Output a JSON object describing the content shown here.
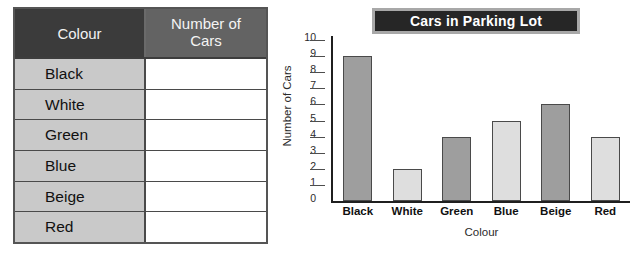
{
  "worksheet": {
    "table": {
      "headers": [
        "Colour",
        "Number of\nCars"
      ],
      "header_colour": "Colour",
      "header_count_line1": "Number of",
      "header_count_line2": "Cars",
      "rows": [
        {
          "label": "Black",
          "value": ""
        },
        {
          "label": "White",
          "value": ""
        },
        {
          "label": "Green",
          "value": ""
        },
        {
          "label": "Blue",
          "value": ""
        },
        {
          "label": "Beige",
          "value": ""
        },
        {
          "label": "Red",
          "value": ""
        }
      ]
    }
  },
  "chart_data": {
    "type": "bar",
    "title": "Cars in Parking Lot",
    "xlabel": "Colour",
    "ylabel": "Number of Cars",
    "categories": [
      "Black",
      "White",
      "Green",
      "Blue",
      "Beige",
      "Red"
    ],
    "values": [
      9,
      2,
      4,
      5,
      6,
      4
    ],
    "bar_shades": [
      "dark",
      "light",
      "dark",
      "light",
      "dark",
      "light"
    ],
    "ylim": [
      0,
      10
    ],
    "yticks": [
      10,
      9,
      8,
      7,
      6,
      5,
      4,
      3,
      2,
      1,
      0
    ],
    "grid": false,
    "legend": "none"
  },
  "colors": {
    "title_banner_bg": "#262626",
    "title_banner_border": "#a8a8a8",
    "title_text": "#ffffff",
    "table_header_dark": "#3b3b3b",
    "table_header_light": "#636363",
    "table_label_cell": "#c9c9c9",
    "table_value_cell": "#ffffff",
    "bar_dark": "#9e9e9e",
    "bar_light": "#dedede",
    "bar_stroke": "#4a4a4a",
    "axis": "#1f1f1f"
  }
}
